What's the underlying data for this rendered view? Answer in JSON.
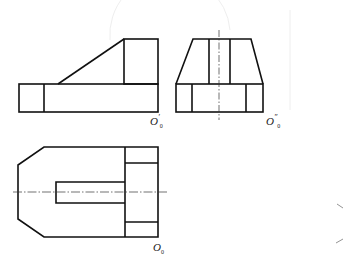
{
  "drawing": {
    "type": "orthographic three-view projection",
    "stroke_color": "#111111",
    "views": {
      "front": {
        "label": "O",
        "label_prime": "′",
        "label_sub": "0",
        "outer_box": [
          19,
          84,
          158,
          112
        ],
        "divider_x": 44,
        "slope": [
          [
            58,
            84
          ],
          [
            124,
            39
          ]
        ],
        "upper_box": [
          124,
          39,
          158,
          84
        ]
      },
      "side": {
        "label": "O",
        "label_prime": "″",
        "label_sub": "0",
        "base": [
          176,
          84,
          263,
          112
        ],
        "base_dividers_x": [
          192,
          246
        ],
        "trapezoid_top": [
          193,
          39,
          251,
          39
        ],
        "inner_dividers_x": [
          209,
          230
        ],
        "center_x": 219
      },
      "top": {
        "label": "O",
        "label_sub": "0",
        "outline": [
          [
            44,
            147
          ],
          [
            158,
            147
          ],
          [
            158,
            237
          ],
          [
            44,
            237
          ],
          [
            18,
            219
          ],
          [
            18,
            165
          ]
        ],
        "right_block_x": 125,
        "right_block_lines_y": [
          163,
          222
        ],
        "slot": [
          56,
          182,
          125,
          203
        ],
        "center_y": 192
      }
    }
  }
}
